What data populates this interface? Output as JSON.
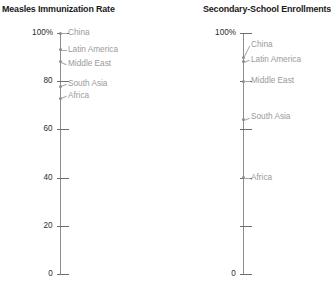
{
  "chart_data": [
    {
      "type": "scatter",
      "title": "Measles Immunization Rate",
      "xlabel": "",
      "ylabel": "",
      "ylim": [
        0,
        100
      ],
      "grid": false,
      "legend": "none",
      "axis_unit_suffix": "%",
      "tick_values": [
        100,
        80,
        60,
        40,
        20,
        0
      ],
      "tick_labels": [
        "100%",
        "80",
        "60",
        "40",
        "20",
        "0"
      ],
      "categories": [
        "China",
        "Latin America",
        "Middle East",
        "South Asia",
        "Africa"
      ],
      "values": [
        100,
        93,
        88,
        78,
        73
      ],
      "points": [
        {
          "label": "China",
          "value": 100,
          "label_y": 100
        },
        {
          "label": "Latin America",
          "value": 93,
          "label_y": 93
        },
        {
          "label": "Middle East",
          "value": 88,
          "label_y": 87
        },
        {
          "label": "South Asia",
          "value": 78,
          "label_y": 79
        },
        {
          "label": "Africa",
          "value": 73,
          "label_y": 74
        }
      ]
    },
    {
      "type": "scatter",
      "title": "Secondary-School Enrollments",
      "xlabel": "",
      "ylabel": "",
      "ylim": [
        0,
        100
      ],
      "grid": false,
      "legend": "none",
      "axis_unit_suffix": "%",
      "tick_values": [
        100,
        80,
        60,
        40,
        20,
        0
      ],
      "tick_labels": [
        "100%",
        "",
        "",
        "",
        "",
        "0"
      ],
      "categories": [
        "China",
        "Latin America",
        "Middle East",
        "South Asia",
        "Africa"
      ],
      "values": [
        90,
        88,
        80,
        64,
        40
      ],
      "points": [
        {
          "label": "China",
          "value": 90,
          "label_y": 95
        },
        {
          "label": "Latin America",
          "value": 88,
          "label_y": 89
        },
        {
          "label": "Middle East",
          "value": 80,
          "label_y": 80
        },
        {
          "label": "South Asia",
          "value": 64,
          "label_y": 65
        },
        {
          "label": "Africa",
          "value": 40,
          "label_y": 40
        }
      ]
    }
  ],
  "colors": {
    "axis": "#8c8c8c",
    "tick": "#6e6e6e",
    "tick_label": "#2b2b2b",
    "point_label": "#9a9a9a",
    "marker": "#8a8a8a",
    "leader": "#a8a8a8",
    "title": "#1a1a1a",
    "background": "#ffffff"
  }
}
